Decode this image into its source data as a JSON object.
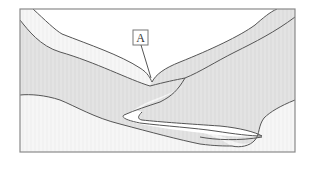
{
  "diagram": {
    "title": "",
    "type": "geological cross-section (folded rock layers)",
    "labels": [
      {
        "id": "A",
        "text": "A",
        "points_to": "layer between upper band and fold"
      }
    ],
    "colors": {
      "frame": "#8a8a8a",
      "stroke": "#555555",
      "shaded_layer": "#dcdcdc",
      "light_layer": "#f3f3f3",
      "white": "#ffffff"
    }
  }
}
